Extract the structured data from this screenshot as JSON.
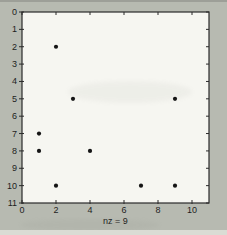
{
  "figure": {
    "kind": "matlab-spy-plot",
    "background_color": "#b7bab1",
    "plot_background_color": "#f6f6f1",
    "axis_color": "#2b2b2b",
    "dot_color": "#151515",
    "text_color": "#1e1e1e"
  },
  "chart_data": {
    "type": "scatter",
    "title": "",
    "xlabel": "nz = 9",
    "ylabel": "",
    "xlim": [
      0,
      11
    ],
    "ylim": [
      0,
      11
    ],
    "y_axis_reversed": true,
    "grid": false,
    "legend": null,
    "x_ticks": [
      0,
      2,
      4,
      6,
      8,
      10
    ],
    "y_ticks": [
      0,
      1,
      2,
      3,
      4,
      5,
      6,
      7,
      8,
      9,
      10,
      11
    ],
    "nonzero_count": 9,
    "points": [
      {
        "x": 2,
        "y": 2
      },
      {
        "x": 3,
        "y": 5
      },
      {
        "x": 9,
        "y": 5
      },
      {
        "x": 1,
        "y": 7
      },
      {
        "x": 1,
        "y": 8
      },
      {
        "x": 4,
        "y": 8
      },
      {
        "x": 2,
        "y": 10
      },
      {
        "x": 7,
        "y": 10
      },
      {
        "x": 9,
        "y": 10
      }
    ]
  }
}
